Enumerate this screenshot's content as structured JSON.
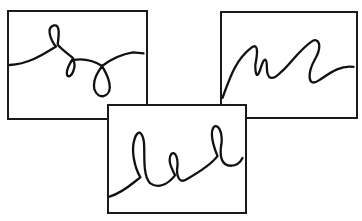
{
  "figure": {
    "panels": [
      {
        "id": "a",
        "description": "wavy line with loops",
        "stroke_color": "#111111"
      },
      {
        "id": "b",
        "description": "zigzag wave line",
        "stroke_color": "#111111"
      },
      {
        "id": "c",
        "description": "line with tall cursive loops",
        "stroke_color": "#111111"
      }
    ],
    "border_color": "#1a1a1a",
    "background": "#ffffff"
  }
}
